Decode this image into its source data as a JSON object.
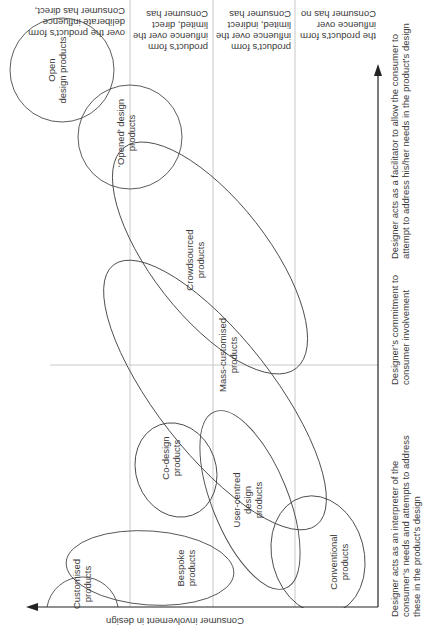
{
  "diagram": {
    "y_axis_label": "Consumer involvement in design",
    "x_axis_labels": [
      [
        "Designer acts as an interpreter of the",
        "consumer’s needs and attempts to address",
        "these in the product’s design"
      ],
      [
        "Designer’s commitment to",
        "consumer involvement"
      ],
      [
        "Designer acts as a facilitator to allow the consumer to",
        "attempt to address his/her needs in the product’s design"
      ]
    ],
    "level_labels": [
      [
        "Consumer has direct,",
        "deliberate influence",
        "over the product’s form"
      ],
      [
        "Consumer has",
        "limited, direct",
        "influence over the",
        "product’s form"
      ],
      [
        "Consumer has",
        "limited, indirect",
        "influence over the",
        "product’s form"
      ],
      [
        "Consumer has no",
        "influence over",
        "the product’s form"
      ]
    ],
    "categories": {
      "open": [
        "Open",
        "design products"
      ],
      "opened": [
        "‘Opened’ design",
        "products"
      ],
      "crowdsourced": [
        "Crowdsourced",
        "products"
      ],
      "mass_customised": [
        "Mass-customised",
        "products"
      ],
      "co_design": [
        "Co-design",
        "products"
      ],
      "user_centred": [
        "User-centred",
        "design",
        "products"
      ],
      "conventional": [
        "Conventional",
        "products"
      ],
      "bespoke": [
        "Bespoke",
        "products"
      ],
      "customised": [
        "Customised",
        "products"
      ]
    }
  }
}
